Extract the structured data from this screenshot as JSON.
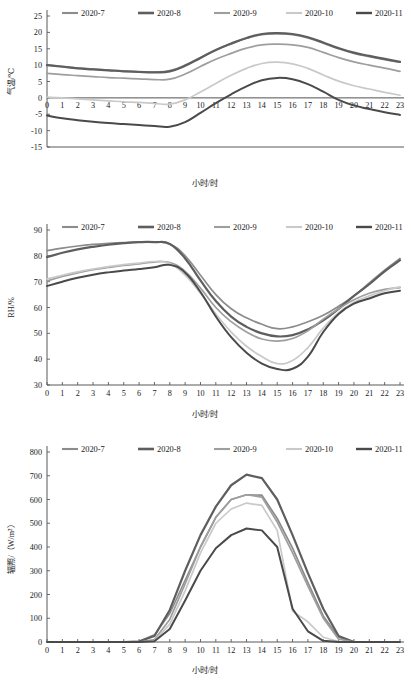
{
  "figure": {
    "n_panels": 3,
    "x_label": "小时/时",
    "hours": [
      0,
      1,
      2,
      3,
      4,
      5,
      6,
      7,
      8,
      9,
      10,
      11,
      12,
      13,
      14,
      15,
      16,
      17,
      18,
      19,
      20,
      21,
      22,
      23
    ],
    "legend_labels": [
      "2020-7",
      "2020-8",
      "2020-9",
      "2020-10",
      "2020-11"
    ],
    "series_colors": [
      "#8c8c8c",
      "#5e5e5e",
      "#9e9e9e",
      "#c9c9c9",
      "#4a4a4a"
    ],
    "series_widths": [
      1.7,
      2.2,
      1.7,
      1.7,
      2.0
    ]
  },
  "chart_data": [
    {
      "type": "line",
      "title": "",
      "xlabel": "小时/时",
      "ylabel": "气温/℃",
      "x": [
        0,
        1,
        2,
        3,
        4,
        5,
        6,
        7,
        8,
        9,
        10,
        11,
        12,
        13,
        14,
        15,
        16,
        17,
        18,
        19,
        20,
        21,
        22,
        23
      ],
      "xlim": [
        0,
        23
      ],
      "ylim": [
        -15,
        25
      ],
      "yticks": [
        -15,
        -10,
        -5,
        0,
        5,
        10,
        15,
        20,
        25
      ],
      "xticks": [
        0,
        1,
        2,
        3,
        4,
        5,
        6,
        7,
        8,
        9,
        10,
        11,
        12,
        13,
        14,
        15,
        16,
        17,
        18,
        19,
        20,
        21,
        22,
        23
      ],
      "grid": false,
      "legend_position": "top",
      "series": [
        {
          "name": "2020-7",
          "values": [
            10.1,
            9.6,
            9.1,
            8.8,
            8.5,
            8.2,
            8.0,
            7.9,
            8.3,
            10.0,
            12.3,
            14.6,
            16.5,
            18.2,
            19.3,
            19.6,
            19.3,
            18.3,
            16.7,
            15.0,
            13.6,
            12.6,
            11.7,
            10.9
          ]
        },
        {
          "name": "2020-8",
          "values": [
            10.0,
            9.5,
            9.0,
            8.7,
            8.4,
            8.1,
            7.9,
            7.8,
            8.1,
            9.8,
            12.2,
            14.6,
            16.6,
            18.3,
            19.5,
            19.8,
            19.5,
            18.5,
            16.9,
            15.2,
            13.8,
            12.8,
            11.9,
            11.0
          ]
        },
        {
          "name": "2020-9",
          "values": [
            7.5,
            7.1,
            6.8,
            6.5,
            6.2,
            6.0,
            5.8,
            5.6,
            5.7,
            7.3,
            9.6,
            11.8,
            13.6,
            15.2,
            16.2,
            16.4,
            16.2,
            15.4,
            13.9,
            12.3,
            11.0,
            10.0,
            9.1,
            8.1
          ]
        },
        {
          "name": "2020-10",
          "values": [
            0.2,
            0.0,
            -0.3,
            -0.6,
            -0.9,
            -1.2,
            -1.4,
            -1.7,
            -1.9,
            -0.6,
            1.8,
            4.4,
            6.9,
            9.0,
            10.5,
            10.9,
            10.4,
            9.0,
            7.0,
            5.1,
            3.7,
            2.7,
            1.7,
            0.8
          ]
        },
        {
          "name": "2020-11",
          "values": [
            -5.4,
            -6.2,
            -6.8,
            -7.3,
            -7.7,
            -8.0,
            -8.3,
            -8.6,
            -8.8,
            -7.4,
            -4.6,
            -1.6,
            1.1,
            3.5,
            5.4,
            6.1,
            5.7,
            4.2,
            1.9,
            -0.6,
            -2.3,
            -3.4,
            -4.4,
            -5.2
          ]
        }
      ]
    },
    {
      "type": "line",
      "title": "",
      "xlabel": "小时/时",
      "ylabel": "RH/%",
      "x": [
        0,
        1,
        2,
        3,
        4,
        5,
        6,
        7,
        8,
        9,
        10,
        11,
        12,
        13,
        14,
        15,
        16,
        17,
        18,
        19,
        20,
        21,
        22,
        23
      ],
      "xlim": [
        0,
        23
      ],
      "ylim": [
        30,
        90
      ],
      "yticks": [
        30,
        40,
        50,
        60,
        70,
        80,
        90
      ],
      "xticks": [
        0,
        1,
        2,
        3,
        4,
        5,
        6,
        7,
        8,
        9,
        10,
        11,
        12,
        13,
        14,
        15,
        16,
        17,
        18,
        19,
        20,
        21,
        22,
        23
      ],
      "grid": false,
      "legend_position": "top",
      "series": [
        {
          "name": "2020-7",
          "values": [
            82.0,
            83.0,
            83.8,
            84.4,
            84.8,
            85.1,
            85.3,
            85.3,
            84.6,
            80.0,
            72.5,
            65.0,
            59.5,
            56.0,
            53.5,
            51.8,
            52.5,
            54.5,
            57.0,
            60.5,
            64.5,
            69.5,
            74.5,
            79.0
          ]
        },
        {
          "name": "2020-8",
          "values": [
            79.5,
            81.2,
            82.5,
            83.5,
            84.3,
            84.9,
            85.3,
            85.3,
            84.6,
            79.0,
            70.5,
            62.5,
            56.5,
            52.5,
            50.0,
            48.8,
            49.3,
            51.5,
            55.0,
            59.5,
            64.5,
            69.0,
            74.0,
            78.3
          ]
        },
        {
          "name": "2020-9",
          "values": [
            70.3,
            72.0,
            73.4,
            74.6,
            75.5,
            76.3,
            76.9,
            77.6,
            77.4,
            74.0,
            67.5,
            60.0,
            54.5,
            50.5,
            47.8,
            47.0,
            48.0,
            51.0,
            55.5,
            59.5,
            63.0,
            65.5,
            67.0,
            67.7
          ]
        },
        {
          "name": "2020-10",
          "values": [
            71.0,
            72.5,
            73.8,
            74.9,
            75.8,
            76.6,
            77.2,
            77.8,
            77.0,
            72.5,
            65.5,
            57.5,
            50.5,
            45.0,
            41.0,
            38.3,
            39.5,
            44.5,
            52.0,
            58.0,
            62.0,
            64.5,
            66.5,
            68.0
          ]
        },
        {
          "name": "2020-11",
          "values": [
            68.3,
            70.0,
            71.5,
            72.7,
            73.6,
            74.3,
            74.9,
            75.6,
            76.5,
            73.5,
            66.0,
            56.5,
            48.5,
            42.5,
            38.3,
            36.2,
            36.3,
            41.0,
            50.5,
            57.5,
            61.5,
            63.5,
            65.5,
            66.5
          ]
        }
      ]
    },
    {
      "type": "line",
      "title": "",
      "xlabel": "小时/时",
      "ylabel": "辐照/（W/m²）",
      "x": [
        0,
        1,
        2,
        3,
        4,
        5,
        6,
        7,
        8,
        9,
        10,
        11,
        12,
        13,
        14,
        15,
        16,
        17,
        18,
        19,
        20,
        21,
        22,
        23
      ],
      "xlim": [
        0,
        23
      ],
      "ylim": [
        0,
        800
      ],
      "yticks": [
        0,
        100,
        200,
        300,
        400,
        500,
        600,
        700,
        800
      ],
      "xticks": [
        0,
        1,
        2,
        3,
        4,
        5,
        6,
        7,
        8,
        9,
        10,
        11,
        12,
        13,
        14,
        15,
        16,
        17,
        18,
        19,
        20,
        21,
        22,
        23
      ],
      "grid": false,
      "legend_position": "top",
      "series": [
        {
          "name": "2020-7",
          "values": [
            0,
            0,
            0,
            0,
            0,
            0,
            3,
            30,
            120,
            260,
            400,
            525,
            600,
            620,
            618,
            520,
            395,
            250,
            110,
            20,
            0,
            0,
            0,
            0
          ]
        },
        {
          "name": "2020-8",
          "values": [
            0,
            0,
            0,
            0,
            0,
            0,
            2,
            25,
            135,
            300,
            450,
            570,
            660,
            705,
            690,
            600,
            450,
            290,
            140,
            25,
            0,
            0,
            0,
            0
          ]
        },
        {
          "name": "2020-9",
          "values": [
            0,
            0,
            0,
            0,
            0,
            0,
            0,
            10,
            95,
            245,
            400,
            525,
            600,
            620,
            610,
            505,
            375,
            235,
            100,
            12,
            0,
            0,
            0,
            0
          ]
        },
        {
          "name": "2020-10",
          "values": [
            0,
            0,
            0,
            0,
            0,
            0,
            0,
            5,
            75,
            215,
            375,
            500,
            560,
            585,
            575,
            470,
            130,
            85,
            20,
            2,
            0,
            0,
            0,
            0
          ]
        },
        {
          "name": "2020-11",
          "values": [
            0,
            0,
            0,
            0,
            0,
            0,
            0,
            3,
            55,
            175,
            300,
            395,
            450,
            478,
            470,
            400,
            140,
            45,
            5,
            0,
            0,
            0,
            0,
            0
          ]
        }
      ]
    }
  ]
}
